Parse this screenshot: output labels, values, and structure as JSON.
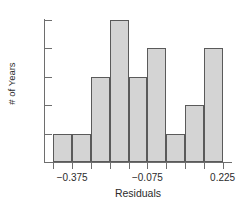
{
  "chart_data": {
    "type": "bar",
    "title": "",
    "subtitle": "",
    "xlabel": "Residuals",
    "ylabel": "# of Years",
    "grid": false,
    "legend": null,
    "bin_width": 0.075,
    "bin_edges": [
      -0.45,
      -0.375,
      -0.3,
      -0.225,
      -0.15,
      -0.075,
      0.0,
      0.075,
      0.15,
      0.225
    ],
    "categories": [
      "-0.450 to -0.375",
      "-0.375 to -0.300",
      "-0.300 to -0.225",
      "-0.225 to -0.150",
      "-0.150 to -0.075",
      "-0.075 to 0.000",
      "0.000 to 0.075",
      "0.075 to 0.150",
      "0.150 to 0.225"
    ],
    "values": [
      1,
      1,
      3,
      5,
      3,
      4,
      1,
      2,
      4
    ],
    "xlim": [
      -0.4875,
      0.2625
    ],
    "ylim": [
      0,
      5
    ],
    "x_tick_values": [
      -0.375,
      -0.075,
      0.225
    ],
    "x_tick_labels": [
      "−0.375",
      "−0.075",
      "0.225"
    ],
    "y_tick_values": [
      1,
      2,
      3,
      4,
      5
    ],
    "y_tick_labels": [
      "1",
      "2",
      "3",
      "4",
      "5"
    ]
  },
  "colors": {
    "bar_fill": "#d4d4d4",
    "bar_stroke": "#5a5a5a",
    "axis": "#6e6e6e",
    "text": "#2b2b2b",
    "background": "#ffffff"
  }
}
